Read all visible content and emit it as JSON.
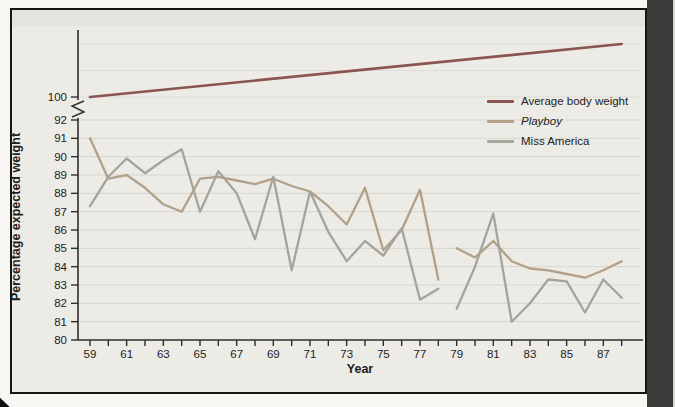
{
  "figure": {
    "y_axis_label": "Percentage expected weight",
    "x_axis_label": "Year",
    "legend": [
      {
        "label": "Average body weight",
        "color": "#8a5550",
        "italic": false
      },
      {
        "label": "Playboy",
        "color": "#b3a089",
        "italic": true
      },
      {
        "label": "Miss America",
        "color": "#a4a49b",
        "italic": false
      }
    ]
  },
  "chart_data": {
    "type": "line",
    "title": "",
    "xlabel": "Year",
    "ylabel": "Percentage expected weight",
    "x_tick_labels": [
      59,
      61,
      63,
      65,
      67,
      69,
      71,
      73,
      75,
      77,
      79,
      81,
      83,
      85,
      87
    ],
    "x_minor_tick_range": [
      59,
      88
    ],
    "y_tick_labels": [
      80,
      81,
      82,
      83,
      84,
      85,
      86,
      87,
      88,
      89,
      90,
      91,
      92,
      100
    ],
    "y_axis_break_between": [
      92,
      100
    ],
    "ylim_lower_section": [
      80,
      92
    ],
    "grid": true,
    "upper_section_grid_levels": [
      100,
      102.5,
      105
    ],
    "legend_position": "upper right inside",
    "series": [
      {
        "name": "Average body weight",
        "color": "#8a5550",
        "width": 2.6,
        "segments": [
          {
            "x": [
              59,
              88
            ],
            "y": [
              100,
              105
            ]
          }
        ]
      },
      {
        "name": "Playboy",
        "color": "#b3a089",
        "width": 2.3,
        "segments": [
          {
            "x": [
              59,
              60,
              61,
              62,
              63,
              64,
              65,
              66,
              67,
              68,
              69,
              70,
              71,
              72,
              73,
              74,
              75,
              76,
              77,
              78
            ],
            "y": [
              91.0,
              88.8,
              89.0,
              88.3,
              87.4,
              87.0,
              88.8,
              88.9,
              88.7,
              88.5,
              88.8,
              88.4,
              88.1,
              87.3,
              86.3,
              88.3,
              84.9,
              86.0,
              88.2,
              83.3
            ]
          },
          {
            "x": [
              79,
              80,
              81,
              82,
              83,
              84,
              85,
              86,
              87,
              88
            ],
            "y": [
              85.0,
              84.5,
              85.4,
              84.3,
              83.9,
              83.8,
              83.6,
              83.4,
              83.8,
              84.3
            ]
          }
        ]
      },
      {
        "name": "Miss America",
        "color": "#a4a49b",
        "width": 2.3,
        "segments": [
          {
            "x": [
              59,
              60,
              61,
              62,
              63,
              64,
              65,
              66,
              67,
              68,
              69,
              70,
              71,
              72,
              73,
              74,
              75,
              76,
              77,
              78
            ],
            "y": [
              87.3,
              88.9,
              89.9,
              89.1,
              89.8,
              90.4,
              87.0,
              89.2,
              88.0,
              85.5,
              88.9,
              83.8,
              88.1,
              85.9,
              84.3,
              85.4,
              84.6,
              86.1,
              82.2,
              82.8
            ]
          },
          {
            "x": [
              79,
              80,
              81,
              82,
              83,
              84,
              85,
              86,
              87,
              88
            ],
            "y": [
              81.7,
              84.0,
              86.9,
              81.0,
              82.0,
              83.3,
              83.2,
              81.5,
              83.3,
              82.3
            ]
          }
        ]
      }
    ]
  }
}
